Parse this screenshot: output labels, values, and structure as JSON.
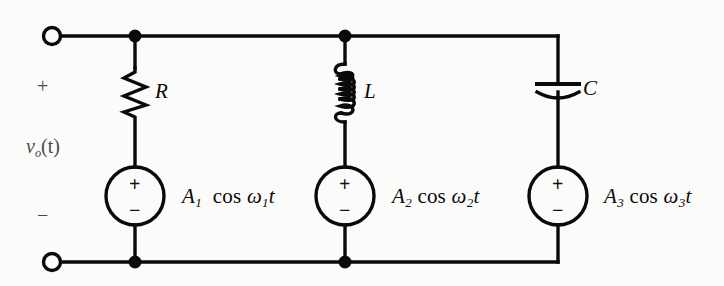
{
  "figure": {
    "type": "circuit-schematic",
    "background_color": "#fbfbf9",
    "line_color": "#0a0a0a"
  },
  "port": {
    "plus_sign": "+",
    "minus_sign": "−",
    "label_v": "v",
    "label_sub": "o",
    "label_arg": "(t)",
    "terminal_top_name": "open-terminal-top",
    "terminal_bottom_name": "open-terminal-bottom"
  },
  "components": [
    {
      "id": "branch-1",
      "element_type": "resistor",
      "element_label": "R",
      "source_label_A": "A",
      "source_sub": "1",
      "source_cos": "cos",
      "source_omega": "ω",
      "source_omega_sub": "1",
      "source_t": "t",
      "source_plus": "+",
      "source_minus": "−",
      "formula_text": "A₁ cos ω₁t"
    },
    {
      "id": "branch-2",
      "element_type": "inductor",
      "element_label": "L",
      "source_label_A": "A",
      "source_sub": "2",
      "source_cos": "cos",
      "source_omega": "ω",
      "source_omega_sub": "2",
      "source_t": "t",
      "source_plus": "+",
      "source_minus": "−",
      "formula_text": "A₂ cos ω₂t"
    },
    {
      "id": "branch-3",
      "element_type": "capacitor",
      "element_label": "C",
      "source_label_A": "A",
      "source_sub": "3",
      "source_cos": "cos",
      "source_omega": "ω",
      "source_omega_sub": "3",
      "source_t": "t",
      "source_plus": "+",
      "source_minus": "−",
      "formula_text": "A₃ cos ω₃t"
    }
  ]
}
